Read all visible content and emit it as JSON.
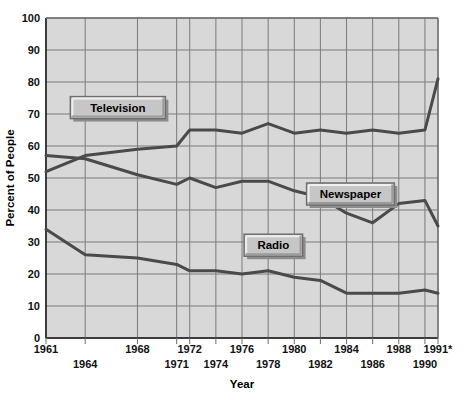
{
  "chart_data": {
    "type": "line",
    "title": "",
    "xlabel": "Year",
    "ylabel": "Percent of People",
    "xlim": [
      1961,
      1991
    ],
    "ylim": [
      0,
      100
    ],
    "grid": true,
    "legend_position": "inline-labels",
    "y_ticks": [
      0,
      10,
      20,
      30,
      40,
      50,
      60,
      70,
      80,
      90,
      100
    ],
    "y_tick_labels": [
      "0",
      "10",
      "20",
      "30",
      "40",
      "50",
      "60",
      "70",
      "80",
      "90",
      "100"
    ],
    "x_ticks": [
      1961,
      1964,
      1968,
      1971,
      1972,
      1974,
      1976,
      1978,
      1980,
      1982,
      1984,
      1986,
      1988,
      1990,
      1991
    ],
    "x_tick_labels_upper": [
      "1961",
      "1968",
      "1972",
      "1976",
      "1980",
      "1984",
      "1988",
      "1991*"
    ],
    "x_tick_labels_lower": [
      "1964",
      "1971",
      "1974",
      "1978",
      "1982",
      "1986",
      "1990"
    ],
    "x": [
      1961,
      1964,
      1968,
      1971,
      1972,
      1974,
      1976,
      1978,
      1980,
      1982,
      1984,
      1986,
      1988,
      1990,
      1991
    ],
    "series": [
      {
        "name": "Television",
        "color": "#4a4a4a",
        "values": [
          52,
          57,
          59,
          60,
          65,
          65,
          64,
          67,
          64,
          65,
          64,
          65,
          64,
          65,
          81
        ]
      },
      {
        "name": "Newspaper",
        "color": "#4a4a4a",
        "values": [
          57,
          56,
          51,
          48,
          50,
          47,
          49,
          49,
          46,
          44,
          39,
          36,
          42,
          43,
          35
        ]
      },
      {
        "name": "Radio",
        "color": "#4a4a4a",
        "values": [
          34,
          26,
          25,
          23,
          21,
          21,
          20,
          21,
          19,
          18,
          14,
          14,
          14,
          15,
          14
        ]
      }
    ],
    "annotations": [
      {
        "label": "Television",
        "x": 1966.5,
        "y": 72
      },
      {
        "label": "Newspaper",
        "x": 1984.3,
        "y": 45
      },
      {
        "label": "Radio",
        "x": 1978.4,
        "y": 29
      }
    ],
    "colors": {
      "plot_background": "#d8d8d8",
      "grid_line": "#7a7a7a",
      "axis_line": "#3d3d3d",
      "series_line": "#4a4a4a",
      "label_box_fill": "#c6c6c6",
      "label_box_border": "#6e6e6e",
      "label_box_highlight": "#efefef",
      "page_background": "#ffffff",
      "text": "#000000"
    }
  }
}
